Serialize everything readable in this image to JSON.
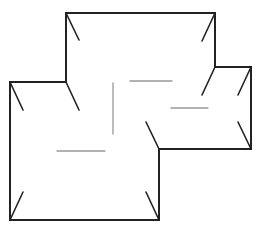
{
  "diagram": {
    "width": 257,
    "height": 232,
    "background": "#ffffff",
    "outline": {
      "color": "#222222",
      "stroke_width": 2,
      "points": "66,13 215,13 215,67 251,67 251,149 159,149 159,220 10,220 10,82 66,82"
    },
    "corner_ticks": {
      "color": "#222222",
      "stroke_width": 1.6,
      "lines": [
        {
          "x1": 66,
          "y1": 13,
          "x2": 79,
          "y2": 40
        },
        {
          "x1": 215,
          "y1": 13,
          "x2": 202,
          "y2": 41
        },
        {
          "x1": 215,
          "y1": 67,
          "x2": 202,
          "y2": 95
        },
        {
          "x1": 251,
          "y1": 67,
          "x2": 238,
          "y2": 95
        },
        {
          "x1": 251,
          "y1": 149,
          "x2": 238,
          "y2": 122
        },
        {
          "x1": 159,
          "y1": 149,
          "x2": 146,
          "y2": 122
        },
        {
          "x1": 159,
          "y1": 220,
          "x2": 146,
          "y2": 192
        },
        {
          "x1": 10,
          "y1": 220,
          "x2": 23,
          "y2": 192
        },
        {
          "x1": 10,
          "y1": 82,
          "x2": 23,
          "y2": 110
        },
        {
          "x1": 66,
          "y1": 82,
          "x2": 79,
          "y2": 110
        }
      ]
    },
    "interior_lines": {
      "color": "#999999",
      "stroke_width": 1.3,
      "lines": [
        {
          "x1": 113,
          "y1": 83,
          "x2": 113,
          "y2": 134
        },
        {
          "x1": 130,
          "y1": 81,
          "x2": 172,
          "y2": 81
        },
        {
          "x1": 171,
          "y1": 108,
          "x2": 208,
          "y2": 108
        },
        {
          "x1": 57,
          "y1": 151,
          "x2": 105,
          "y2": 151
        }
      ]
    }
  }
}
